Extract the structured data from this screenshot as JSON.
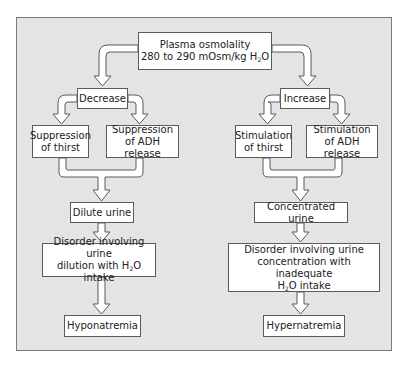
{
  "diagram": {
    "root": {
      "line1": "Plasma osmolality",
      "line2_pre": "280 to 290 mOsm/kg H",
      "line2_sub": "2",
      "line2_post": "O"
    },
    "left": {
      "branch": "Decrease",
      "effect_a": {
        "line1": "Suppression",
        "line2": "of thirst"
      },
      "effect_b": {
        "line1": "Suppression",
        "line2": "of ADH release"
      },
      "urine": "Dilute urine",
      "disorder": {
        "line1": "Disorder involving urine",
        "line2_pre": "dilution with H",
        "line2_sub": "2",
        "line2_post": "O intake"
      },
      "outcome": "Hyponatremia"
    },
    "right": {
      "branch": "Increase",
      "effect_a": {
        "line1": "Stimulation",
        "line2": "of thirst"
      },
      "effect_b": {
        "line1": "Stimulation",
        "line2": "of ADH release"
      },
      "urine": "Concentrated urine",
      "disorder": {
        "line1": "Disorder involving urine",
        "line2": "concentration with inadequate",
        "line3_pre": "H",
        "line3_sub": "2",
        "line3_post": "O intake"
      },
      "outcome": "Hypernatremia"
    }
  },
  "colors": {
    "panel_bg": "#e4e4e4",
    "box_bg": "#ffffff",
    "stroke": "#5a5a5a"
  }
}
